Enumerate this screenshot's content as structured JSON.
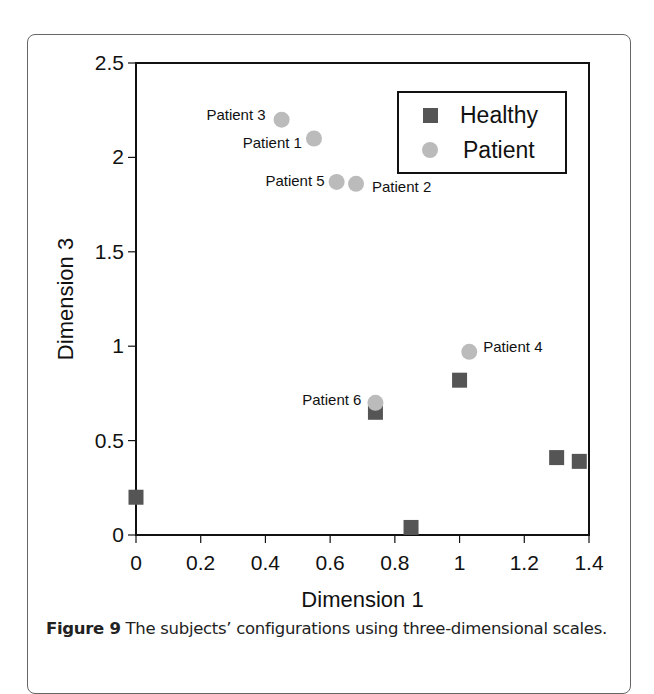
{
  "chart_data": {
    "type": "scatter",
    "title": "",
    "xlabel": "Dimension 1",
    "ylabel": "Dimension 3",
    "xlim": [
      0,
      1.4
    ],
    "ylim": [
      0,
      2.5
    ],
    "xticks": [
      "0",
      "0.2",
      "0.4",
      "0.6",
      "0.8",
      "1",
      "1.2",
      "1.4"
    ],
    "yticks": [
      "0",
      "0.5",
      "1",
      "1.5",
      "2",
      "2.5"
    ],
    "grid": false,
    "legend_position": "upper right",
    "series": [
      {
        "name": "Healthy",
        "marker": "square",
        "color": "#555555",
        "points": [
          {
            "x": 0.0,
            "y": 0.2
          },
          {
            "x": 0.85,
            "y": 0.04
          },
          {
            "x": 0.74,
            "y": 0.65
          },
          {
            "x": 1.0,
            "y": 0.82
          },
          {
            "x": 1.3,
            "y": 0.41
          },
          {
            "x": 1.37,
            "y": 0.39
          }
        ]
      },
      {
        "name": "Patient",
        "marker": "circle",
        "color": "#bbbbbb",
        "points": [
          {
            "x": 0.45,
            "y": 2.2,
            "label": "Patient 3"
          },
          {
            "x": 0.55,
            "y": 2.1,
            "label": "Patient 1"
          },
          {
            "x": 0.62,
            "y": 1.87,
            "label": "Patient 5"
          },
          {
            "x": 0.68,
            "y": 1.86,
            "label": "Patient 2"
          },
          {
            "x": 1.03,
            "y": 0.97,
            "label": "Patient 4"
          },
          {
            "x": 0.74,
            "y": 0.7,
            "label": "Patient 6"
          }
        ]
      }
    ]
  },
  "caption": {
    "label": "Figure 9",
    "text": " The subjects’ configurations using three-dimensional scales."
  }
}
